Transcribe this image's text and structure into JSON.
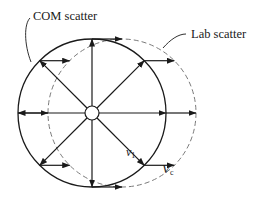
{
  "diagram": {
    "labels": {
      "com_scatter": "COM scatter",
      "lab_scatter": "Lab scatter",
      "v1_symbol": "v",
      "v1_subscript": "1",
      "vc_symbol": "V",
      "vc_subscript": "c"
    },
    "geometry": {
      "com_circle": {
        "cx": 92,
        "cy": 113,
        "r": 74,
        "style": "solid"
      },
      "lab_circle": {
        "cx": 122,
        "cy": 113,
        "r": 74,
        "style": "dashed"
      },
      "center_circle": {
        "cx": 92,
        "cy": 113,
        "r": 7
      },
      "vc_offset": 30,
      "radial_arrow_angles_deg": [
        0,
        45,
        90,
        135,
        180,
        225,
        270,
        315
      ]
    },
    "colors": {
      "stroke": "#1a1a1a",
      "dashed_stroke": "#7a7a7a",
      "background": "#ffffff"
    }
  }
}
